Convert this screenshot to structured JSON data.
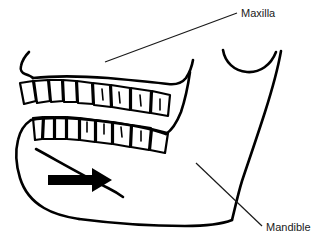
{
  "diagram": {
    "background_color": "#ffffff",
    "ink_color": "#000000",
    "label_color": "#1a1a1a",
    "width": 334,
    "height": 252
  },
  "labels": {
    "maxilla": {
      "text": "Maxilla",
      "x": 241,
      "y": 14,
      "leader_from": [
        105,
        62
      ],
      "leader_to": [
        237,
        13
      ]
    },
    "mandible": {
      "text": "Mandible",
      "x": 266,
      "y": 228,
      "leader_from": [
        196,
        163
      ],
      "leader_to": [
        262,
        226
      ]
    }
  },
  "arrow": {
    "name": "forward-motion-arrow",
    "direction": "right",
    "tail_x": 48,
    "tip_x": 112,
    "y": 180
  },
  "teeth": {
    "upper_count": 8,
    "lower_count": 8,
    "upper_row_label": "maxillary teeth",
    "lower_row_label": "mandibular teeth"
  },
  "structures": [
    {
      "name": "maxilla-body",
      "label": "Maxilla"
    },
    {
      "name": "mandible-body",
      "label": "Mandible"
    },
    {
      "name": "mandibular-ramus",
      "label": "Ramus"
    },
    {
      "name": "mandibular-notch",
      "label": "Notch"
    },
    {
      "name": "chin",
      "label": "Chin"
    }
  ]
}
